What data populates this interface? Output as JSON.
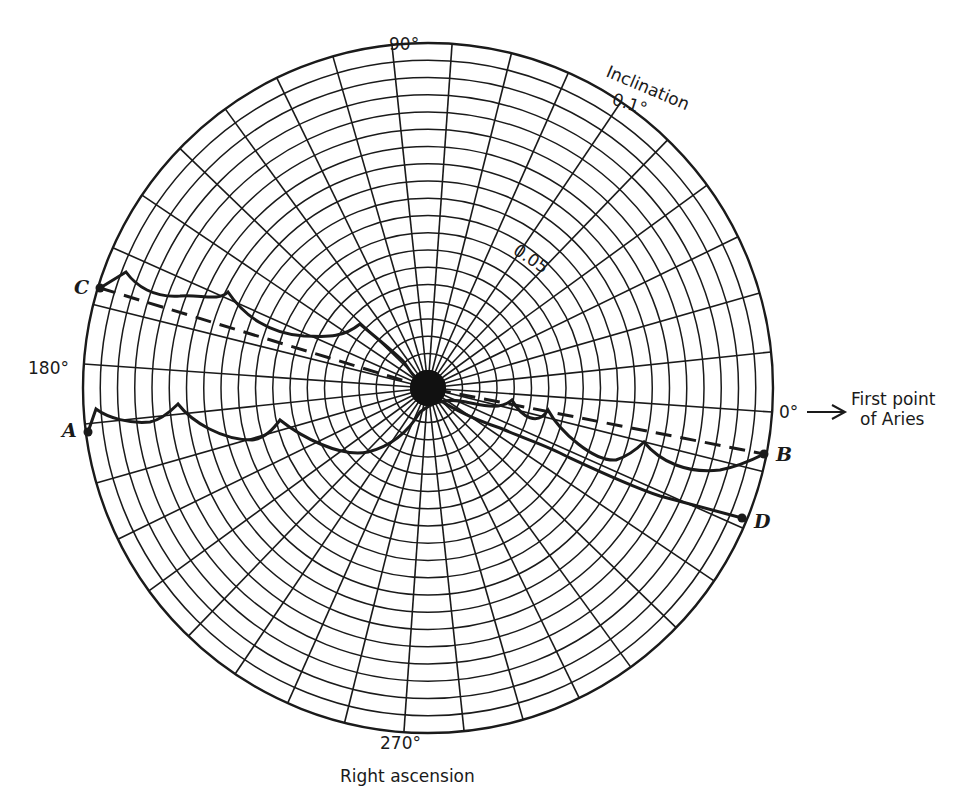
{
  "figure": {
    "type": "polar-diagram",
    "axis_labels": {
      "deg_90": "90°",
      "deg_180": "180°",
      "deg_270": "270°",
      "deg_0": "0°",
      "radial_title": "Inclination",
      "radial_outer": "0.1°",
      "radial_mid": "0.05",
      "angular_title": "Right ascension",
      "reference_line1": "First point",
      "reference_line2": "of Aries"
    },
    "points": {
      "A": "A",
      "B": "B",
      "C": "C",
      "D": "D"
    },
    "colors": {
      "ink": "#1a1a1a",
      "background": "#ffffff"
    }
  },
  "chart_data": {
    "type": "polar",
    "title": "",
    "angular_axis": {
      "label": "Right ascension",
      "unit": "deg",
      "range": [
        0,
        360
      ],
      "tick_step": 10,
      "labeled_ticks": [
        0,
        90,
        180,
        270
      ],
      "zero_reference": "First point of Aries"
    },
    "radial_axis": {
      "label": "Inclination",
      "unit": "deg",
      "range": [
        0,
        0.1
      ],
      "ring_step": 0.005,
      "labeled_ticks": [
        0.05,
        0.1
      ]
    },
    "grid": true,
    "geometry": {
      "cx": 428,
      "cy": 388,
      "radius": 345,
      "rotation_deg": 4
    },
    "series": [
      {
        "name": "Path A to B (cusped)",
        "style": "solid",
        "from": "A",
        "to": "B",
        "points": [
          [
            189.5,
            0.0995
          ],
          [
            186.5,
            0.0932
          ],
          [
            183.0,
            0.09
          ],
          [
            178.5,
            0.0902
          ],
          [
            174.8,
            0.0905
          ],
          [
            172.0,
            0.0935
          ],
          [
            168.8,
            0.091
          ],
          [
            165.0,
            0.09
          ],
          [
            160.0,
            0.092
          ],
          [
            153.0,
            0.096
          ],
          [
            146.5,
            0.1
          ],
          [
            138.0,
            0.105
          ],
          [
            124.0,
            0.116
          ],
          [
            108.0,
            0.128
          ],
          [
            72.0,
            0.103
          ],
          [
            55.0,
            0.084
          ],
          [
            40.0,
            0.07
          ],
          [
            27.0,
            0.06
          ],
          [
            16.0,
            0.052
          ],
          [
            7.0,
            0.046
          ],
          [
            0.0,
            0.042
          ],
          [
            350.0,
            0.038
          ],
          [
            338.0,
            0.036
          ],
          [
            322.0,
            0.038
          ],
          [
            305.0,
            0.043
          ],
          [
            290.0,
            0.05
          ],
          [
            276.0,
            0.058
          ],
          [
            262.0,
            0.062
          ]
        ]
      },
      {
        "name": "Path C to D (cusped)",
        "style": "solid",
        "from": "C",
        "to": "D",
        "points": [
          [
            160.0,
            0.1
          ],
          [
            158.0,
            0.092
          ],
          [
            155.0,
            0.086
          ],
          [
            150.5,
            0.079
          ],
          [
            146.0,
            0.076
          ],
          [
            141.8,
            0.077
          ],
          [
            140.5,
            0.074
          ],
          [
            136.0,
            0.068
          ],
          [
            129.0,
            0.061
          ],
          [
            122.0,
            0.056
          ],
          [
            114.0,
            0.053
          ],
          [
            108.0,
            0.052
          ],
          [
            100.0,
            0.048
          ],
          [
            85.0,
            0.039
          ],
          [
            65.0,
            0.028
          ],
          [
            40.0,
            0.017
          ],
          [
            10.0,
            0.008
          ],
          [
            330.0,
            0.003
          ],
          [
            250.0,
            0.004
          ],
          [
            220.0,
            0.012
          ],
          [
            205.0,
            0.021
          ],
          [
            196.0,
            0.03
          ],
          [
            190.0,
            0.039
          ],
          [
            186.0,
            0.049
          ],
          [
            183.0,
            0.058
          ],
          [
            181.0,
            0.068
          ],
          [
            179.0,
            0.078
          ],
          [
            177.0,
            0.088
          ],
          [
            175.0,
            0.096
          ]
        ]
      },
      {
        "name": "Mean path C to B",
        "style": "dashed",
        "from": "C",
        "to": "B",
        "points": [
          [
            160.0,
            0.1
          ],
          [
            0.0,
            0.0
          ],
          [
            352.5,
            0.1
          ]
        ]
      }
    ]
  }
}
